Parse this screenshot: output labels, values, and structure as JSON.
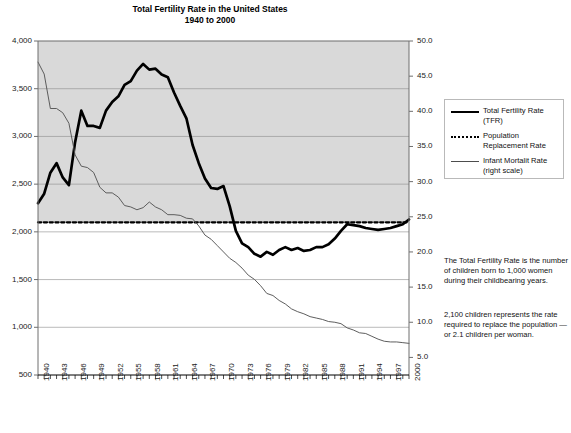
{
  "header": {
    "title_line1": "Total Fertility Rate in the United States",
    "title_line2": "1940 to 2000",
    "title_full": "Total Fertility Rate in the United States\n1940 to 2000"
  },
  "legend": {
    "items": [
      {
        "label": "Total Fertility Rate\n(TFR)",
        "style": "thick-solid-black",
        "color": "#000000"
      },
      {
        "label": "Population\nReplacement Rate",
        "style": "dotted-black",
        "color": "#000000"
      },
      {
        "label": "Infant Mortalit Rate\n(right scale)",
        "style": "thin-solid-gray",
        "color": "#4d4d4d"
      }
    ]
  },
  "notes": [
    "The Total Fertility Rate is the number of children born to 1,000 women during their childbearing years.",
    "2,100 children represents the rate required to replace the population — or 2.1 children per woman."
  ],
  "colors": {
    "plot_band_fill": "#d9d9d9",
    "plot_lower_fill": "#ffffff",
    "gridline": "#8c8c8c",
    "axis": "#6e6e6e",
    "tfr_line": "#000000",
    "replacement_line": "#000000",
    "infant_line": "#555555",
    "text": "#111111"
  },
  "chart_data": {
    "type": "line",
    "title": "Total Fertility Rate in the United States\n1940 to 2000",
    "xlabel": "",
    "ylabel": "",
    "grid": true,
    "legend_position": "right-top",
    "xlim": [
      1940,
      2000
    ],
    "ylim": [
      500,
      4000
    ],
    "y2lim": [
      2.5,
      50.0
    ],
    "yticks": [
      4000,
      3500,
      3000,
      2500,
      2000,
      1500,
      1000,
      500
    ],
    "ytick_labels": [
      "4,000",
      "3,500",
      "3,000",
      "2,500",
      "2,000",
      "1,500",
      "1,000",
      "500"
    ],
    "y2ticks": [
      50.0,
      45.0,
      40.0,
      35.0,
      30.0,
      25.0,
      20.0,
      15.0,
      10.0,
      5.0
    ],
    "y2tick_labels": [
      "50.0",
      "45.0",
      "40.0",
      "35.0",
      "30.0",
      "25.0",
      "20.0",
      "15.0",
      "10.0",
      "5.0"
    ],
    "xticks": [
      1940,
      1943,
      1946,
      1949,
      1952,
      1955,
      1958,
      1961,
      1964,
      1967,
      1970,
      1973,
      1976,
      1979,
      1982,
      1985,
      1988,
      1991,
      1994,
      1997,
      2000
    ],
    "xtick_labels": [
      "1940",
      "1943",
      "1946",
      "1949",
      "1952",
      "1955",
      "1958",
      "1961",
      "1964",
      "1967",
      "1970",
      "1973",
      "1976",
      "1979",
      "1982",
      "1985",
      "1988",
      "1991",
      "1994",
      "1997",
      "2000"
    ],
    "x": [
      1940,
      1941,
      1942,
      1943,
      1944,
      1945,
      1946,
      1947,
      1948,
      1949,
      1950,
      1951,
      1952,
      1953,
      1954,
      1955,
      1956,
      1957,
      1958,
      1959,
      1960,
      1961,
      1962,
      1963,
      1964,
      1965,
      1966,
      1967,
      1968,
      1969,
      1970,
      1971,
      1972,
      1973,
      1974,
      1975,
      1976,
      1977,
      1978,
      1979,
      1980,
      1981,
      1982,
      1983,
      1984,
      1985,
      1986,
      1987,
      1988,
      1989,
      1990,
      1991,
      1992,
      1993,
      1994,
      1995,
      1996,
      1997,
      1998,
      1999,
      2000
    ],
    "series": [
      {
        "name": "Total Fertility Rate (TFR)",
        "axis": "left",
        "style": "thick-solid",
        "color": "#000000",
        "values": [
          2300,
          2400,
          2620,
          2720,
          2570,
          2490,
          2940,
          3270,
          3110,
          3110,
          3090,
          3270,
          3360,
          3420,
          3540,
          3580,
          3690,
          3760,
          3700,
          3710,
          3650,
          3620,
          3460,
          3320,
          3190,
          2910,
          2720,
          2560,
          2460,
          2450,
          2480,
          2270,
          2010,
          1880,
          1840,
          1770,
          1740,
          1790,
          1760,
          1810,
          1840,
          1810,
          1830,
          1800,
          1810,
          1840,
          1840,
          1870,
          1930,
          2010,
          2080,
          2070,
          2060,
          2040,
          2030,
          2020,
          2030,
          2040,
          2060,
          2080,
          2130
        ]
      },
      {
        "name": "Population Replacement Rate",
        "axis": "left",
        "style": "dotted",
        "color": "#000000",
        "constant": 2100,
        "values": [
          2100,
          2100,
          2100,
          2100,
          2100,
          2100,
          2100,
          2100,
          2100,
          2100,
          2100,
          2100,
          2100,
          2100,
          2100,
          2100,
          2100,
          2100,
          2100,
          2100,
          2100,
          2100,
          2100,
          2100,
          2100,
          2100,
          2100,
          2100,
          2100,
          2100,
          2100,
          2100,
          2100,
          2100,
          2100,
          2100,
          2100,
          2100,
          2100,
          2100,
          2100,
          2100,
          2100,
          2100,
          2100,
          2100,
          2100,
          2100,
          2100,
          2100,
          2100,
          2100,
          2100,
          2100,
          2100,
          2100,
          2100,
          2100,
          2100,
          2100,
          2100
        ]
      },
      {
        "name": "Infant Mortalit Rate (right scale)",
        "axis": "right",
        "style": "thin-solid",
        "color": "#555555",
        "values": [
          47.0,
          45.3,
          40.4,
          40.4,
          39.8,
          38.3,
          33.8,
          32.2,
          32.0,
          31.3,
          29.2,
          28.4,
          28.4,
          27.8,
          26.6,
          26.4,
          26.0,
          26.3,
          27.1,
          26.4,
          26.0,
          25.3,
          25.3,
          25.2,
          24.8,
          24.7,
          23.7,
          22.4,
          21.8,
          20.9,
          20.0,
          19.1,
          18.5,
          17.7,
          16.7,
          16.1,
          15.2,
          14.1,
          13.8,
          13.1,
          12.6,
          11.9,
          11.5,
          11.2,
          10.8,
          10.6,
          10.4,
          10.1,
          10.0,
          9.8,
          9.2,
          8.9,
          8.5,
          8.4,
          8.0,
          7.6,
          7.3,
          7.2,
          7.2,
          7.1,
          7.0
        ]
      }
    ],
    "annotations": [
      "The Total Fertility Rate is the number of children born to 1,000 women during their childbearing years.",
      "2,100 children represents the rate required to replace the population — or 2.1 children per woman."
    ]
  }
}
